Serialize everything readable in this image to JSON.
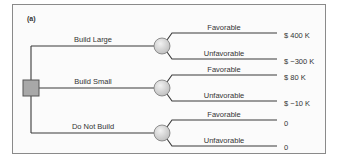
{
  "panel_label": "(a)",
  "decision_node": {
    "shape": "square",
    "fill": "#a8a8a8"
  },
  "alternatives": [
    {
      "label": "Build Large",
      "chance_node": "circle",
      "outcomes": [
        {
          "label": "Favorable",
          "payoff": "$ 400 K"
        },
        {
          "label": "Unfavorable",
          "payoff": "$ −300 K"
        }
      ]
    },
    {
      "label": "Build Small",
      "chance_node": "circle",
      "outcomes": [
        {
          "label": "Favorable",
          "payoff": "$ 80 K"
        },
        {
          "label": "Unfavorable",
          "payoff": "$ −10 K"
        }
      ]
    },
    {
      "label": "Do Not Build",
      "chance_node": "circle",
      "outcomes": [
        {
          "label": "Favorable",
          "payoff": "0"
        },
        {
          "label": "Unfavorable",
          "payoff": "0"
        }
      ]
    }
  ],
  "colors": {
    "line": "#3a3a3a",
    "frame": "#8a8a8a",
    "circle_fill": "#d8d8d8",
    "square_fill": "#a8a8a8",
    "text": "#333333"
  }
}
